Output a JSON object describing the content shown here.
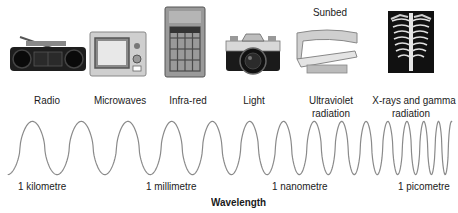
{
  "diagram": {
    "axis_title": "Wavelength",
    "items": [
      {
        "label": "Radio",
        "icon": "radio-icon"
      },
      {
        "label": "Microwaves",
        "icon": "microwave-oven-icon"
      },
      {
        "label": "Infra-red",
        "icon": "heater-icon"
      },
      {
        "label": "Light",
        "icon": "camera-icon"
      },
      {
        "label_line1": "Ultraviolet",
        "label_line2": "radiation",
        "icon": "sunbed-icon",
        "icon_caption": "Sunbed"
      },
      {
        "label_line1": "X-rays and gamma",
        "label_line2": "radiation",
        "icon": "xray-chest-icon"
      }
    ],
    "scale_labels": [
      "1 kilometre",
      "1 millimetre",
      "1 nanometre",
      "1 picometre"
    ],
    "colors": {
      "wave": "#8a8a8a",
      "text": "#1a1a1a",
      "xray_bg": "#111111"
    }
  }
}
